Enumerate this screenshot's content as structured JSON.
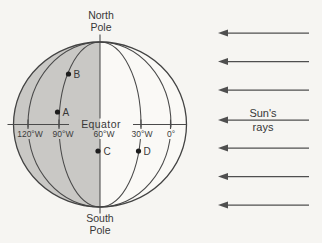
{
  "figure": {
    "globe": {
      "north_pole": {
        "line1": "North",
        "line2": "Pole"
      },
      "south_pole": {
        "line1": "South",
        "line2": "Pole"
      },
      "equator_label": "Equator",
      "meridians": [
        {
          "label": "120°W"
        },
        {
          "label": "90°W"
        },
        {
          "label": "60°W"
        },
        {
          "label": "30°W"
        },
        {
          "label": "0°"
        }
      ],
      "points": [
        {
          "label": "A"
        },
        {
          "label": "B"
        },
        {
          "label": "C"
        },
        {
          "label": "D"
        }
      ]
    },
    "sun_rays": {
      "label_line1": "Sun's",
      "label_line2": "rays",
      "ray_count": 7
    },
    "colors": {
      "line": "#4a4a4a",
      "shading": "#c9c8c5",
      "text": "#383838",
      "background": "#f6f5f2"
    }
  }
}
